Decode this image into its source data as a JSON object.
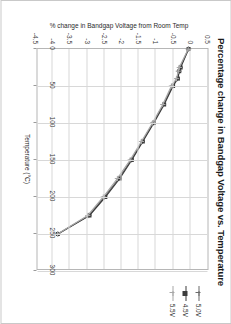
{
  "chart_data": {
    "type": "line",
    "title": "Percentage change in Bandgap Voltage vs. Temperature",
    "xlabel": "Temperature (°C)",
    "ylabel": "% change in Bandgap Voltage from Room Temp",
    "xlim": [
      0,
      300
    ],
    "ylim": [
      -4.5,
      0.5
    ],
    "xticks": [
      "0",
      "50",
      "100",
      "150",
      "200",
      "250",
      "300"
    ],
    "yticks": [
      "0.5",
      "0",
      "-0.5",
      "-1",
      "-1.5",
      "-2",
      "-2.5",
      "-3",
      "-3.5",
      "-4",
      "-4.5"
    ],
    "grid": true,
    "legend_position": "top-right",
    "x": [
      0,
      25,
      30,
      40,
      50,
      75,
      100,
      125,
      150,
      175,
      200,
      225,
      250
    ],
    "series": [
      {
        "name": "5.0V",
        "color": "#6a6a6a",
        "marker": "plus",
        "values": [
          -0.05,
          -0.3,
          -0.33,
          -0.38,
          -0.52,
          -0.78,
          -1.08,
          -1.4,
          -1.72,
          -2.08,
          -2.5,
          -2.95,
          -3.85
        ]
      },
      {
        "name": "4.5V",
        "color": "#3c3c3c",
        "marker": "square",
        "values": [
          -0.05,
          -0.28,
          -0.32,
          -0.36,
          -0.5,
          -0.76,
          -1.06,
          -1.38,
          -1.7,
          -2.05,
          -2.47,
          -2.93,
          -3.85
        ]
      },
      {
        "name": "5.5V",
        "color": "#a8a8a8",
        "marker": "plus",
        "values": [
          -0.06,
          -0.32,
          -0.35,
          -0.4,
          -0.55,
          -0.8,
          -1.1,
          -1.42,
          -1.75,
          -2.12,
          -2.53,
          -2.98,
          -3.86
        ]
      }
    ]
  },
  "legend": {
    "items": [
      {
        "label": "5.0V"
      },
      {
        "label": "4.5V"
      },
      {
        "label": "5.5V"
      }
    ]
  }
}
